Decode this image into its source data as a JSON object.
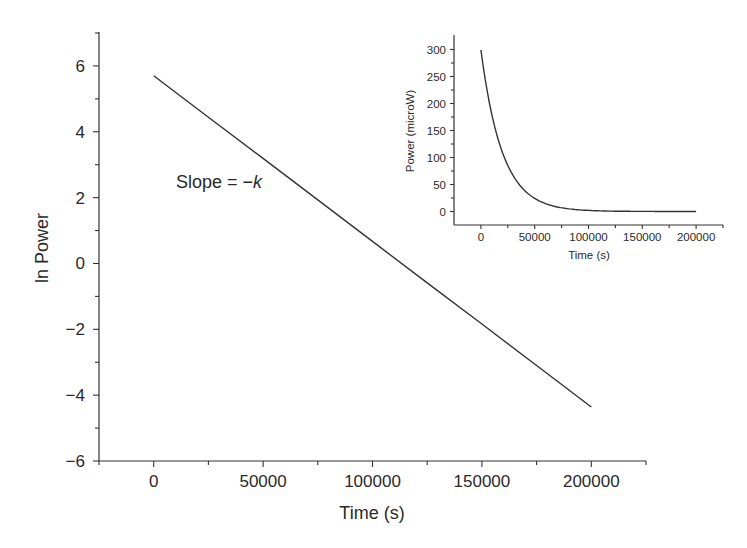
{
  "chart_data": [
    {
      "id": "main",
      "type": "line",
      "title": "",
      "xlabel": "Time (s)",
      "ylabel": "ln Power",
      "xlim": [
        -25000,
        225000
      ],
      "ylim": [
        -6,
        7
      ],
      "xticks": [
        0,
        50000,
        100000,
        150000,
        200000
      ],
      "xtick_labels": [
        "0",
        "50000",
        "100000",
        "150000",
        "200000"
      ],
      "yticks": [
        -6,
        -4,
        -2,
        0,
        2,
        4,
        6
      ],
      "ytick_labels": [
        "−6",
        "−4",
        "−2",
        "0",
        "2",
        "4",
        "6"
      ],
      "yminor_ticks": [
        -5,
        -3,
        -1,
        1,
        3,
        5,
        7
      ],
      "xminor_ticks": [
        -25000,
        25000,
        75000,
        125000,
        175000,
        225000
      ],
      "grid": false,
      "legend": null,
      "series": [
        {
          "name": "ln Power",
          "x": [
            0,
            25000,
            50000,
            75000,
            100000,
            125000,
            150000,
            175000,
            200000
          ],
          "y": [
            5.7,
            4.44,
            3.19,
            1.93,
            0.67,
            -0.59,
            -1.84,
            -3.1,
            -4.36
          ]
        }
      ],
      "annotations": [
        {
          "text": "Slope = −",
          "italic_suffix": "k",
          "x": 52000,
          "y": 2.3
        }
      ]
    },
    {
      "id": "inset",
      "type": "line",
      "title": "",
      "xlabel": "Time (s)",
      "ylabel": "Power (microW)",
      "xlim": [
        -25000,
        225000
      ],
      "ylim": [
        -25,
        325
      ],
      "xticks": [
        0,
        50000,
        100000,
        150000,
        200000
      ],
      "xtick_labels": [
        "0",
        "50000",
        "100000",
        "150000",
        "200000"
      ],
      "yticks": [
        0,
        50,
        100,
        150,
        200,
        250,
        300
      ],
      "ytick_labels": [
        "0",
        "50",
        "100",
        "150",
        "200",
        "250",
        "300"
      ],
      "yminor_ticks": [
        25,
        75,
        125,
        175,
        225,
        275
      ],
      "xminor_ticks": [
        25000,
        75000,
        125000,
        175000,
        225000
      ],
      "grid": false,
      "legend": null,
      "series": [
        {
          "name": "Power",
          "x": [
            0,
            10000,
            20000,
            30000,
            40000,
            50000,
            60000,
            70000,
            80000,
            90000,
            100000,
            120000,
            140000,
            160000,
            180000,
            200000
          ],
          "y": [
            299,
            181,
            109,
            66,
            40,
            24,
            14.6,
            8.8,
            5.3,
            3.2,
            1.9,
            0.71,
            0.26,
            0.1,
            0.035,
            0.013
          ]
        }
      ]
    }
  ],
  "colors": {
    "line": "#333333",
    "axis": "#333333",
    "text": "#2a2a2a",
    "background": "#ffffff"
  }
}
